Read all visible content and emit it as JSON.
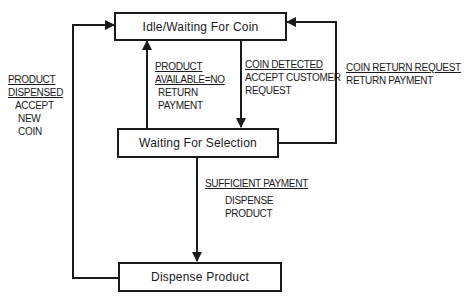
{
  "diagram": {
    "type": "state-machine",
    "states": {
      "idle": "Idle/Waiting For Coin",
      "waiting_selection": "Waiting For Selection",
      "dispense": "Dispense Product"
    },
    "transitions": {
      "product_dispensed": {
        "condition_line1": "PRODUCT",
        "condition_line2": "DISPENSED",
        "action_line1": "ACCEPT",
        "action_line2": "NEW",
        "action_line3": "COIN"
      },
      "product_unavailable": {
        "condition_line1": "PRODUCT",
        "condition_line2": "AVAILABLE=NO",
        "action_line1": "RETURN",
        "action_line2": "PAYMENT"
      },
      "coin_detected": {
        "condition_line1": "COIN DETECTED",
        "action_line1": "ACCEPT CUSTOMER",
        "action_line2": "REQUEST"
      },
      "coin_return": {
        "condition_line1": "COIN RETURN REQUEST",
        "action_line1": "RETURN PAYMENT"
      },
      "sufficient_payment": {
        "condition_line1": "SUFFICIENT PAYMENT",
        "action_line1": "DISPENSE",
        "action_line2": "PRODUCT"
      }
    }
  }
}
